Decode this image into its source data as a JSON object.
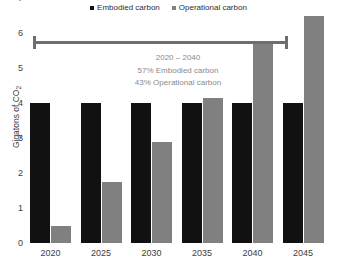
{
  "chart_data": {
    "type": "bar",
    "title": "",
    "xlabel": "",
    "ylabel": "Gigatons of CO",
    "ylabel_sub": "2",
    "categories": [
      "2020",
      "2025",
      "2030",
      "2035",
      "2040",
      "2045"
    ],
    "series": [
      {
        "name": "Embodied carbon",
        "color": "#111111",
        "values": [
          4.0,
          4.0,
          4.0,
          4.0,
          4.0,
          4.0
        ]
      },
      {
        "name": "Operational carbon",
        "color": "#808080",
        "values": [
          0.5,
          1.75,
          2.9,
          4.15,
          5.7,
          6.5
        ]
      }
    ],
    "ylim": [
      0,
      7
    ],
    "yticks": [
      "0",
      "1",
      "2",
      "3",
      "4",
      "5",
      "6",
      "7"
    ],
    "grid": false,
    "legend_position": "top-center"
  },
  "legend": {
    "items": [
      {
        "label": "Embodied carbon",
        "color": "#111111"
      },
      {
        "label": "Operational carbon",
        "color": "#808080"
      }
    ]
  },
  "annotation": {
    "range_label": "2020 – 2040",
    "line1": "57% Embodied carbon",
    "line2": "43% Operational carbon",
    "range_color": "#6e6e6e"
  }
}
